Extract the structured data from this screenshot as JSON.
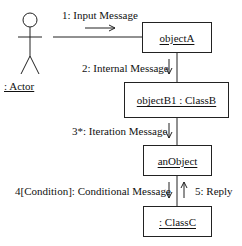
{
  "diagram": {
    "type": "UML communication diagram",
    "actor": {
      "label": ": Actor"
    },
    "objects": [
      {
        "id": "objectA",
        "label": "objectA"
      },
      {
        "id": "objectB1",
        "label": "objectB1 : ClassB"
      },
      {
        "id": "anObject",
        "label": "anObject"
      },
      {
        "id": "classC",
        "label": ": ClassC"
      }
    ],
    "messages": [
      {
        "label": "1: Input Message",
        "from": ": Actor",
        "to": "objectA",
        "direction": "right"
      },
      {
        "label": "2: Internal Message",
        "from": "objectA",
        "to": "objectB1 : ClassB",
        "direction": "down"
      },
      {
        "label": "3*: Iteration Message",
        "from": "objectB1 : ClassB",
        "to": "anObject",
        "direction": "down"
      },
      {
        "label": "4[Condition]: Conditional Message",
        "from": "anObject",
        "to": ": ClassC",
        "direction": "down"
      },
      {
        "label": "5: Reply",
        "from": ": ClassC",
        "to": "anObject",
        "direction": "up"
      }
    ]
  }
}
